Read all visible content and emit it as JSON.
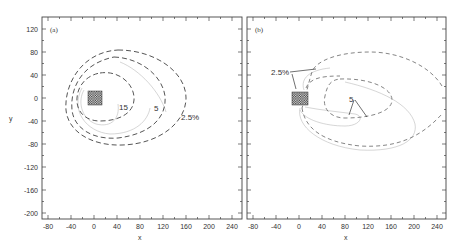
{
  "figure": {
    "width": 464,
    "height": 247
  },
  "chart_data": [
    {
      "type": "contour",
      "panel_label": "(a)",
      "xlabel": "x",
      "ylabel": "y",
      "xlim": [
        -90,
        250
      ],
      "ylim": [
        -210,
        140
      ],
      "x_ticks": [
        -80,
        -40,
        0,
        40,
        80,
        120,
        160,
        200,
        240
      ],
      "y_ticks": [
        120,
        80,
        40,
        0,
        -40,
        -80,
        -120,
        -160,
        -200
      ],
      "grid": false,
      "source_block": {
        "x": [
          -10,
          10
        ],
        "y": [
          -10,
          10
        ],
        "pattern": "checkered"
      },
      "contours": [
        {
          "level": "15",
          "style": "dashed",
          "label_at": [
            45,
            -13
          ],
          "approx_extent": {
            "x": [
              -40,
              70
            ],
            "y": [
              -42,
              42
            ]
          }
        },
        {
          "level": "5",
          "style": "dashed",
          "label_at": [
            108,
            -16
          ],
          "approx_extent": {
            "x": [
              -45,
              125
            ],
            "y": [
              -70,
              72
            ]
          }
        },
        {
          "level": "2.5%",
          "style": "dashed",
          "label_at": [
            150,
            -32
          ],
          "approx_extent": {
            "x": [
              -50,
              160
            ],
            "y": [
              -83,
              83
            ]
          }
        }
      ],
      "annotations": [
        "15",
        "5",
        "2.5%"
      ]
    },
    {
      "type": "contour",
      "panel_label": "(b)",
      "xlabel": "x",
      "ylabel": "y",
      "xlim": [
        -90,
        250
      ],
      "ylim": [
        -210,
        140
      ],
      "x_ticks": [
        -80,
        -40,
        0,
        40,
        80,
        120,
        160,
        200,
        240
      ],
      "y_ticks": [
        120,
        80,
        40,
        0,
        -40,
        -80,
        -120,
        -160,
        -200
      ],
      "grid": false,
      "source_block": {
        "x": [
          -15,
          15
        ],
        "y": [
          -12,
          12
        ],
        "pattern": "checkered"
      },
      "contours": [
        {
          "level": "5",
          "style": "dashed",
          "approx_extent": {
            "x": [
              40,
              165
            ],
            "y": [
              -35,
              35
            ]
          }
        },
        {
          "level": "2.5%",
          "style": "dashed",
          "approx_extent": {
            "x": [
              -10,
              250
            ],
            "y": [
              -85,
              80
            ]
          }
        }
      ],
      "annotations": [
        "2.5%",
        "5"
      ]
    }
  ],
  "panels": [
    {
      "tag": "(a)",
      "xlabel": "x",
      "ylabel": "y",
      "labels": [
        {
          "text": "15",
          "x": 50,
          "y": -13
        },
        {
          "text": "5",
          "x": 108,
          "y": -16
        },
        {
          "text": "2.5%",
          "x": 152,
          "y": -33
        }
      ]
    },
    {
      "tag": "(b)",
      "xlabel": "x",
      "ylabel": "",
      "labels": [
        {
          "text": "2.5%",
          "x": -50,
          "y": 48
        },
        {
          "text": "5",
          "x": 88,
          "y": -2
        }
      ]
    }
  ]
}
